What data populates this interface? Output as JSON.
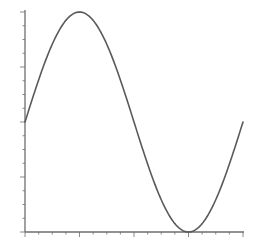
{
  "chart_data": {
    "type": "line",
    "title": "",
    "xlabel": "",
    "ylabel": "",
    "function": "y = sin(x)",
    "xlim": [
      0,
      6.2832
    ],
    "ylim": [
      -1,
      1
    ],
    "grid": false,
    "legend": null,
    "x_tick_labels": [],
    "y_tick_labels": [],
    "x_major_ticks": [
      0,
      1.5708,
      3.1416,
      4.7124,
      6.2832
    ],
    "y_major_ticks": [
      -1,
      -0.5,
      0,
      0.5,
      1
    ],
    "series": [
      {
        "name": "sin(x)",
        "color": "#5a5a5a",
        "x": [
          0,
          0.7854,
          1.5708,
          2.3562,
          3.1416,
          3.927,
          4.7124,
          5.4978,
          6.2832
        ],
        "y": [
          0,
          0.7071,
          1,
          0.7071,
          0,
          -0.7071,
          -1,
          -0.7071,
          0
        ]
      }
    ]
  },
  "plot": {
    "left": 25,
    "right": 243,
    "top": 12,
    "bottom": 232,
    "axis_color": "#6e6e6e",
    "curve_color": "#5a5a5a",
    "x_minor_per_major": 4,
    "y_minor_per_major": 4
  }
}
